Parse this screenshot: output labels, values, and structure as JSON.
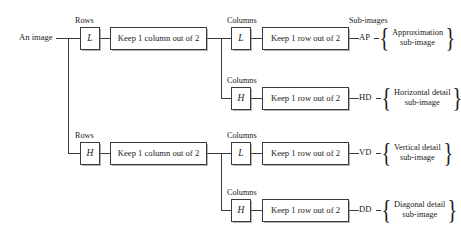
{
  "diagram": {
    "source_label": "An image",
    "column_headers": {
      "rows": "Rows",
      "columns": "Columns",
      "subimages": "Sub-images"
    },
    "filters": {
      "low": "L",
      "high": "H"
    },
    "operations": {
      "keep_column": "Keep 1 column out of 2",
      "keep_row": "Keep 1 row out of 2"
    },
    "branches": [
      {
        "id": "ap",
        "stage1_filter": "L",
        "stage1_header": "Rows",
        "stage1_op": "Keep 1 column out of 2",
        "stage2_filter": "L",
        "stage2_header": "Columns",
        "stage2_op": "Keep 1 row out of 2",
        "code": "AP",
        "caption_line1": "Approximation",
        "caption_line2": "sub-image"
      },
      {
        "id": "hd",
        "stage2_filter": "H",
        "stage2_header": "Columns",
        "stage2_op": "Keep 1 row out of 2",
        "code": "HD",
        "caption_line1": "Horizontal detail",
        "caption_line2": "sub-image"
      },
      {
        "id": "vd",
        "stage1_filter": "H",
        "stage1_header": "Rows",
        "stage1_op": "Keep 1 column out of 2",
        "stage2_filter": "L",
        "stage2_header": "Columns",
        "stage2_op": "Keep 1 row out of 2",
        "code": "VD",
        "caption_line1": "Vertical detail",
        "caption_line2": "sub-image"
      },
      {
        "id": "dd",
        "stage2_filter": "H",
        "stage2_header": "Columns",
        "stage2_op": "Keep 1 row out of 2",
        "code": "DD",
        "caption_line1": "Diagonal detail",
        "caption_line2": "sub-image"
      }
    ],
    "brace_glyph_open": "{",
    "brace_glyph_close": "}",
    "colors": {
      "line": "#3a3a3a",
      "text": "#1a1a1a",
      "background": "#ffffff",
      "shadow": "#787878"
    }
  }
}
